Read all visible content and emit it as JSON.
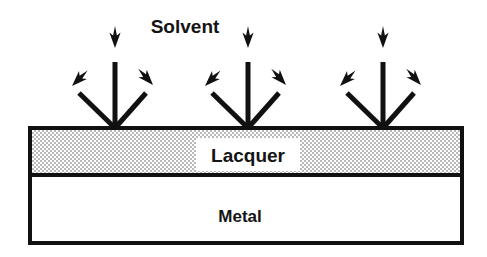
{
  "figure": {
    "background_color": "#ffffff",
    "stroke_color": "#111111",
    "labels": {
      "solvent": "Solvent",
      "lacquer": "Lacquer",
      "metal": "Metal"
    },
    "layers": [
      {
        "name": "lacquer",
        "label": "Lacquer",
        "fill_style": "stipple-dither",
        "fill_color": "#c9c9c9",
        "x": 30,
        "y": 128,
        "width": 432,
        "height": 47
      },
      {
        "name": "metal",
        "label": "Metal",
        "fill_style": "solid",
        "fill_color": "#ffffff",
        "x": 30,
        "y": 175,
        "width": 432,
        "height": 68
      }
    ],
    "label_knockout": {
      "name": "lacquer-label-knockout",
      "fill_color": "#ffffff",
      "x": 196,
      "y": 138,
      "width": 104,
      "height": 33
    },
    "arrow_groups": [
      {
        "name": "arrow-group-left",
        "origin_x": 115,
        "origin_y": 128
      },
      {
        "name": "arrow-group-center",
        "origin_x": 248,
        "origin_y": 128
      },
      {
        "name": "arrow-group-right",
        "origin_x": 383,
        "origin_y": 128
      }
    ],
    "arrow_group_geometry": {
      "vertical": {
        "dx": 0,
        "dy": -80
      },
      "diagonal_left": {
        "dx": -43,
        "dy": -42
      },
      "diagonal_right": {
        "dx": 38,
        "dy": -42
      }
    },
    "label_positions": {
      "solvent": {
        "x": 185,
        "y": 33
      },
      "lacquer": {
        "x": 248,
        "y": 162
      },
      "metal": {
        "x": 240,
        "y": 222
      }
    }
  }
}
